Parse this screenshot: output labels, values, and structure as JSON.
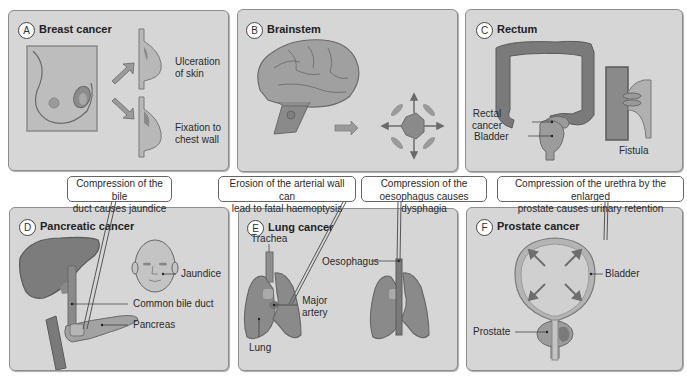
{
  "panels": {
    "a": {
      "badge": "A",
      "title": "Breast cancer",
      "labels": {
        "ulceration": "Ulceration\nof skin",
        "ulceration_l1": "Ulceration",
        "ulceration_l2": "of skin",
        "fixation_l1": "Fixation to",
        "fixation_l2": "chest wall"
      }
    },
    "b": {
      "badge": "B",
      "title": "Brainstem"
    },
    "c": {
      "badge": "C",
      "title": "Rectum",
      "labels": {
        "rectal_l1": "Rectal",
        "rectal_l2": "cancer",
        "bladder": "Bladder",
        "fistula": "Fistula"
      }
    },
    "d": {
      "badge": "D",
      "title": "Pancreatic cancer",
      "labels": {
        "jaundice": "Jaundice",
        "bile_duct": "Common bile duct",
        "pancreas": "Pancreas"
      }
    },
    "e": {
      "badge": "E",
      "title": "Lung cancer",
      "labels": {
        "trachea": "Trachea",
        "oesophagus": "Oesophagus",
        "major_l1": "Major",
        "major_l2": "artery",
        "lung": "Lung"
      }
    },
    "f": {
      "badge": "F",
      "title": "Prostate cancer",
      "labels": {
        "bladder": "Bladder",
        "prostate": "Prostate"
      }
    }
  },
  "callouts": {
    "bile": {
      "l1": "Compression of the bile",
      "l2": "duct causes jaundice"
    },
    "artery": {
      "l1": "Erosion of the arterial wall can",
      "l2": "lead to fatal haemoptysis"
    },
    "oesophagus": {
      "l1": "Compression of the",
      "l2": "oesophagus causes dysphagia"
    },
    "urethra": {
      "l1": "Compression of the urethra by the enlarged",
      "l2": "prostate causes urinary retention"
    }
  },
  "colors": {
    "panel_bg": "#d6d6d6",
    "organ_fill": "#9a9a9a",
    "organ_dark": "#7a7a7a",
    "organ_light": "#b8b8b8",
    "outline": "#5a5a5a"
  }
}
